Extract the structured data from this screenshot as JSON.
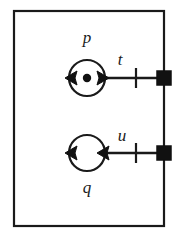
{
  "diagram": {
    "type": "petri-net",
    "background_color": "#ffffff",
    "stroke_color": "#1a1a1a",
    "fill_color": "#111111",
    "boundary": {
      "name": "module-boundary",
      "shape": "rectangle",
      "x": 14,
      "y": 11,
      "width": 150,
      "height": 215
    },
    "places": [
      {
        "id": "p",
        "label": "p",
        "label_position": "above",
        "cx": 87,
        "cy": 78,
        "r": 18,
        "tokens": 1,
        "token_r": 4
      },
      {
        "id": "q",
        "label": "q",
        "label_position": "below",
        "cx": 87,
        "cy": 153,
        "r": 18,
        "tokens": 0,
        "token_r": 4
      }
    ],
    "transitions": [
      {
        "id": "t",
        "label": "t",
        "label_position": "above-left",
        "cx": 164,
        "cy": 78,
        "size": 14
      },
      {
        "id": "u",
        "label": "u",
        "label_position": "above-left",
        "cx": 164,
        "cy": 153,
        "size": 14
      }
    ],
    "arcs": [
      {
        "id": "arc-p-to-t",
        "from": "p",
        "to": "t",
        "direction": "right",
        "tick": true,
        "tick_x": 136
      },
      {
        "id": "arc-u-to-q",
        "from": "u",
        "to": "q",
        "direction": "left",
        "tick": true,
        "tick_x": 136
      },
      {
        "id": "self-loop-p",
        "on": "p",
        "direction": "left",
        "style": "circular-arc"
      },
      {
        "id": "self-loop-q",
        "on": "q",
        "direction": "left",
        "style": "circular-arc"
      }
    ]
  }
}
